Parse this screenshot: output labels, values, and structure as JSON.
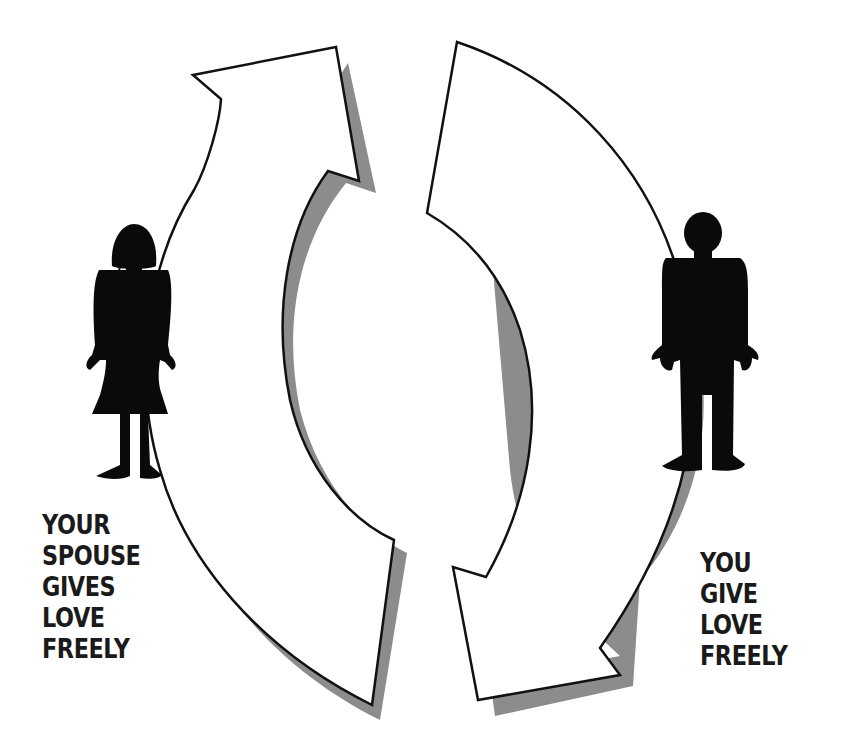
{
  "diagram": {
    "title": "",
    "type": "cycle",
    "nodes": [
      {
        "id": "spouse",
        "figure": "woman-silhouette-icon",
        "label_lines": [
          "YOUR",
          "SPOUSE",
          "GIVES",
          "LOVE",
          "FREELY"
        ]
      },
      {
        "id": "you",
        "figure": "man-silhouette-icon",
        "label_lines": [
          "YOU",
          "GIVE",
          "LOVE",
          "FREELY"
        ]
      }
    ],
    "edges": [
      {
        "from": "spouse",
        "to": "you",
        "direction": "clockwise",
        "arrow": "upper-left-arrow"
      },
      {
        "from": "you",
        "to": "spouse",
        "direction": "clockwise",
        "arrow": "lower-right-arrow"
      }
    ]
  },
  "colors": {
    "arrow_fill": "#ffffff",
    "arrow_stroke": "#111111",
    "shadow": "#8c8c8c",
    "figure": "#0a0a0a",
    "text": "#1a1a1a"
  }
}
